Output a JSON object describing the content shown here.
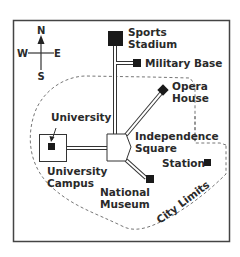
{
  "map": {
    "compass": {
      "north": "N",
      "south": "S",
      "east": "E",
      "west": "W"
    },
    "landmarks": {
      "sports_stadium": {
        "line1": "Sports",
        "line2": "Stadium"
      },
      "military_base": {
        "label": "Military Base"
      },
      "opera_house": {
        "line1": "Opera",
        "line2": "House"
      },
      "university": {
        "label": "University"
      },
      "university_campus": {
        "line1": "University",
        "line2": "Campus"
      },
      "independence_square": {
        "line1": "Independence",
        "line2": "Square"
      },
      "station": {
        "label": "Station"
      },
      "national_museum": {
        "line1": "National",
        "line2": "Museum"
      }
    },
    "city_limits": {
      "label": "City Limits"
    },
    "colors": {
      "ink": "#2a2a2a",
      "frame": "#444444",
      "boundary": "#666666",
      "background": "#ffffff"
    }
  }
}
